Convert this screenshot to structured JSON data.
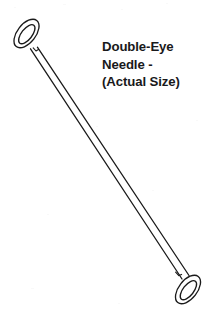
{
  "figure": {
    "background_color": "#ffffff",
    "ink_color": "#1a1a1a",
    "width": 214,
    "height": 317
  },
  "caption": {
    "lines": [
      "Double-Eye",
      "Needle -",
      "(Actual Size)"
    ],
    "line1": "Double-Eye",
    "line2": "Needle -",
    "line3": "(Actual Size)",
    "color": "#19191b"
  },
  "illustration": {
    "subject": "double-eye-needle",
    "description": "Line drawing of a long straight sewing needle with an elongated eye at each end, oriented diagonally from upper-left to lower-right.",
    "parts": {
      "top_eye": "needle-eye-top",
      "shaft": "needle-shaft",
      "bottom_eye": "needle-eye-bottom"
    }
  }
}
